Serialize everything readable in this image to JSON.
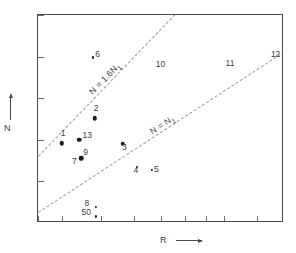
{
  "chart_data": {
    "type": "scatter",
    "title": "",
    "xlabel": "R",
    "ylabel": "N",
    "xscale": "log",
    "yscale": "linear",
    "xlim": [
      3.5,
      14
    ],
    "ylim": [
      10,
      35
    ],
    "grid": false,
    "legend": "none",
    "xticks": [
      3.5,
      4,
      5,
      6,
      7,
      8,
      9,
      10,
      12,
      14
    ],
    "xticklabels": [
      "3.5",
      "4",
      "5",
      "6",
      "7",
      "8",
      "9",
      "10",
      "12",
      "14"
    ],
    "yticks": [
      10,
      15,
      20,
      25,
      30,
      35
    ],
    "yticklabels": [
      "10",
      "15",
      "20",
      "25",
      "30",
      "35"
    ],
    "points": [
      {
        "label": "1",
        "x": 4.0,
        "y": 19.6,
        "marker": "filled-circle",
        "size": "big",
        "label_dx": -1,
        "label_dy": -10
      },
      {
        "label": "2",
        "x": 4.82,
        "y": 22.6,
        "marker": "filled-circle",
        "size": "big",
        "label_dx": -1,
        "label_dy": -10
      },
      {
        "label": "3",
        "x": 5.65,
        "y": 19.5,
        "marker": "filled-circle",
        "size": "big",
        "label_dx": -1,
        "label_dy": 4
      },
      {
        "label": "4",
        "x": 6.1,
        "y": 16.7,
        "marker": "small-dot",
        "size": "small",
        "label_dx": -3,
        "label_dy": 3
      },
      {
        "label": "5",
        "x": 6.65,
        "y": 16.4,
        "marker": "small-dot",
        "size": "small",
        "label_dx": 2,
        "label_dy": 0
      },
      {
        "label": "6",
        "x": 4.78,
        "y": 29.9,
        "marker": "small-dot",
        "size": "small",
        "label_dx": 2,
        "label_dy": -3
      },
      {
        "label": "7",
        "x": 4.46,
        "y": 17.8,
        "marker": "filled-circle",
        "size": "big",
        "label_dx": -9,
        "label_dy": 3
      },
      {
        "label": "8",
        "x": 4.84,
        "y": 11.9,
        "marker": "small-dot",
        "size": "small",
        "label_dx": -11,
        "label_dy": -4
      },
      {
        "label": "9",
        "x": 4.62,
        "y": 18.5,
        "marker": "none",
        "size": "none",
        "label_dx": 0,
        "label_dy": 0
      },
      {
        "label": "10",
        "x": 6.95,
        "y": 29.0,
        "marker": "none",
        "size": "none",
        "label_dx": 0,
        "label_dy": 0
      },
      {
        "label": "11",
        "x": 10.3,
        "y": 29.2,
        "marker": "none",
        "size": "none",
        "label_dx": 0,
        "label_dy": 0
      },
      {
        "label": "12",
        "x": 13.3,
        "y": 30.3,
        "marker": "none",
        "size": "none",
        "label_dx": 0,
        "label_dy": 0
      },
      {
        "label": "13",
        "x": 4.42,
        "y": 20.0,
        "marker": "filled-circle",
        "size": "big",
        "label_dx": 3,
        "label_dy": -4
      },
      {
        "label": "50",
        "x": 4.84,
        "y": 10.8,
        "marker": "small-dot",
        "size": "small",
        "label_dx": -14,
        "label_dy": -4
      }
    ],
    "reference_lines": [
      {
        "name": "upper",
        "label": "N = 1.6N",
        "label_sub": "1",
        "x0": 3.5,
        "y0": 18.0,
        "x1": 7.55,
        "y1": 35.0
      },
      {
        "name": "lower",
        "label": "N = N",
        "label_sub": "1",
        "x0": 3.5,
        "y0": 11.3,
        "x1": 14.0,
        "y1": 30.6
      }
    ]
  },
  "axis_titles": {
    "x": "R",
    "y": "N"
  },
  "icons": {
    "x_arrow": "arrow-right-icon",
    "y_arrow": "arrow-up-icon"
  }
}
